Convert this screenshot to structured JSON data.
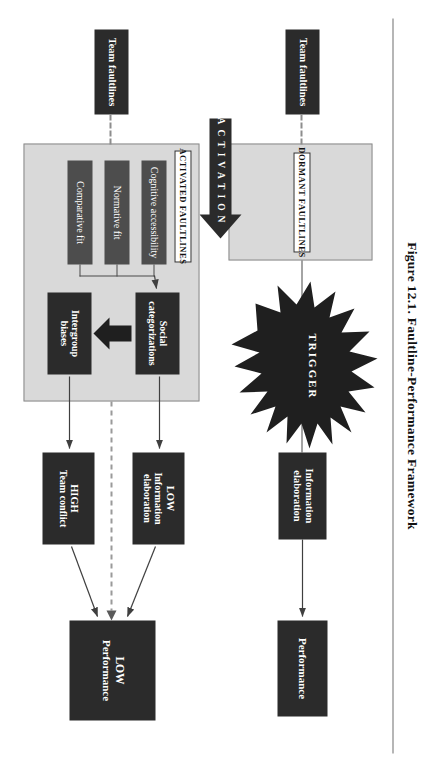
{
  "figure": {
    "title": "Figure 12.1.  Faultline-Performance Framework",
    "accent_dark": "#2b2b2b",
    "accent_gray": "#4d4d4d",
    "panel_fill": "#d9d9d9",
    "line_color": "#4a4a4a"
  },
  "top_path": {
    "panel_label": "DORMANT FAULTLINES",
    "input_box": "Team faultlines",
    "mediator_box": "Information\nelaboration",
    "outcome_box": "Performance"
  },
  "trigger": {
    "label": "TRIGGER",
    "activation_label": "ACTIVATION"
  },
  "bottom_path": {
    "panel_label": "ACTIVATED FAULTLINES",
    "input_box": "Team faultlines",
    "antecedents": [
      "Cognitive accessibility",
      "Normative fit",
      "Comparative fit"
    ],
    "process_boxes": [
      "Social\ncategorizations",
      "Intergroup\nbiases"
    ],
    "mediators": [
      {
        "level": "LOW",
        "label": "Information\nelaboration"
      },
      {
        "level": "HIGH",
        "label": "Team conflict"
      }
    ],
    "outcome": {
      "level": "LOW",
      "label": "Performance"
    }
  }
}
